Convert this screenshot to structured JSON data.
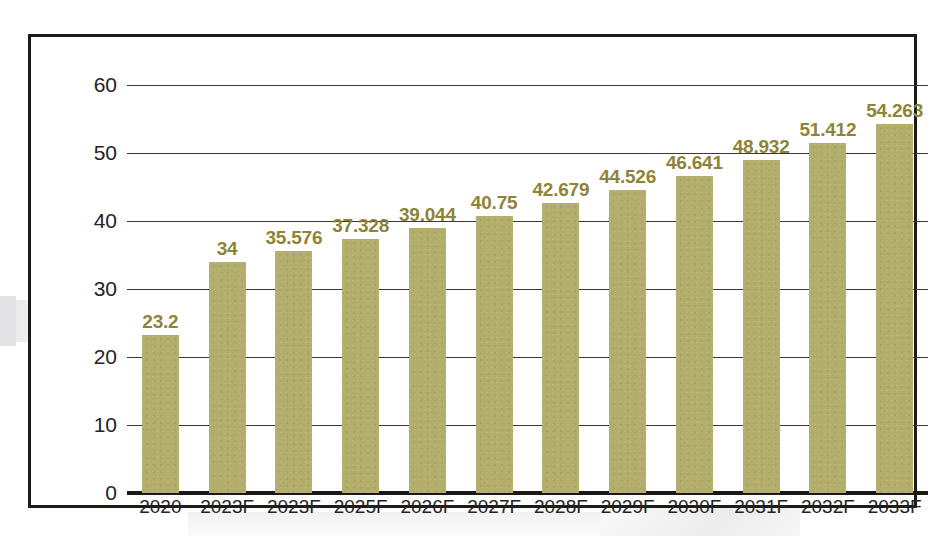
{
  "chart_data": {
    "type": "bar",
    "title": "",
    "subtitle": "",
    "xlabel": "",
    "ylabel": "",
    "ylim": [
      0,
      60
    ],
    "ytick_labels": [
      "60",
      "50",
      "40",
      "30",
      "20",
      "10",
      "0"
    ],
    "yticks": [
      60,
      50,
      40,
      30,
      20,
      10,
      0
    ],
    "grid": true,
    "legend": null,
    "categories": [
      "2020",
      "2023F",
      "2023F",
      "2025F",
      "2026F",
      "2027F",
      "2028F",
      "2029F",
      "2030F",
      "2031F",
      "2032F",
      "2033F"
    ],
    "values": [
      23.2,
      34,
      35.576,
      37.328,
      39.044,
      40.75,
      42.679,
      44.526,
      46.641,
      48.932,
      51.412,
      54.263
    ],
    "value_labels": [
      "23.2",
      "34",
      "35.576",
      "37.328",
      "39.044",
      "40.75",
      "42.679",
      "44.526",
      "46.641",
      "48.932",
      "51.412",
      "54.263"
    ],
    "colors": {
      "bar": "#b3ae6c",
      "value_label": "#8d8438",
      "axis": "#1a1917",
      "gridline": "#3a3936",
      "tick_label": "#232323",
      "frame": "#1c1b1a",
      "background": "#ffffff"
    }
  }
}
